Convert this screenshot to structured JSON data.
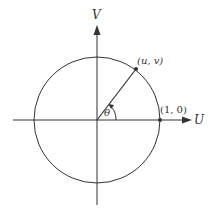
{
  "diagram": {
    "type": "unit-circle",
    "colors": {
      "stroke": "#333333",
      "background": "#ffffff"
    },
    "axes": {
      "horizontal_label": "U",
      "vertical_label": "V"
    },
    "points": {
      "on_circle_label": "(u, v)",
      "unit_point_label": "(1, 0)"
    },
    "angle_label": "θ"
  }
}
